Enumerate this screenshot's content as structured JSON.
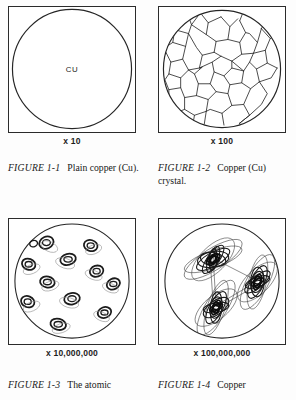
{
  "page": {
    "background_color": "#fdfdfd",
    "ink_color": "#1a1a1a"
  },
  "figures": [
    {
      "id": "figure-1-1",
      "element_label": "CU",
      "magnification": "x 10",
      "caption_number": "FIGURE 1-1",
      "caption_text": "Plain copper (Cu).",
      "depiction": "plain-copper-disc"
    },
    {
      "id": "figure-1-2",
      "element_label": "",
      "magnification": "x 100",
      "caption_number": "FIGURE 1-2",
      "caption_text": "Copper (Cu) crystal.",
      "depiction": "polycrystalline-grain-structure"
    },
    {
      "id": "figure-1-3",
      "element_label": "",
      "magnification": "x 10,000,000",
      "caption_number": "FIGURE 1-3",
      "caption_text": "The atomic",
      "depiction": "scattered-atoms"
    },
    {
      "id": "figure-1-4",
      "element_label": "",
      "magnification": "x 100,000,000",
      "caption_number": "FIGURE 1-4",
      "caption_text": "Copper",
      "depiction": "atoms-with-electron-orbitals"
    }
  ]
}
